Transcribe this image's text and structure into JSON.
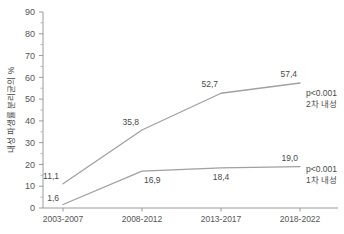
{
  "chart_data": {
    "type": "line",
    "title": "",
    "xlabel": "",
    "ylabel": "내성 파생률 분리균의 %",
    "categories": [
      "2003-2007",
      "2008-2012",
      "2013-2017",
      "2018-2022"
    ],
    "ylim": [
      0,
      90
    ],
    "yticks": [
      0,
      10,
      20,
      30,
      40,
      50,
      60,
      70,
      80,
      90
    ],
    "ytick_labels": [
      "0",
      "10",
      "20",
      "30",
      "40",
      "50",
      "60",
      "70",
      "80",
      "90"
    ],
    "minor_tick_step": 5,
    "grid": false,
    "legend_position": "none",
    "series": [
      {
        "name": "2차 내성",
        "values": [
          11.1,
          35.8,
          52.7,
          57.4
        ],
        "value_labels": [
          "11,1",
          "35,8",
          "52,7",
          "57,4"
        ],
        "color": "#a0a0a0",
        "annotation_pvalue": "p<0.001",
        "annotation_label": "2차 내성"
      },
      {
        "name": "1차 내성",
        "values": [
          1.6,
          16.9,
          18.4,
          19.0
        ],
        "value_labels": [
          "1,6",
          "16,9",
          "18,4",
          "19,0"
        ],
        "color": "#a0a0a0",
        "annotation_pvalue": "p<0.001",
        "annotation_label": "1차 내성"
      }
    ]
  },
  "colors": {
    "axis": "#9a9a9a",
    "line": "#a0a0a0",
    "text": "#4a4a4a",
    "background": "#ffffff"
  }
}
